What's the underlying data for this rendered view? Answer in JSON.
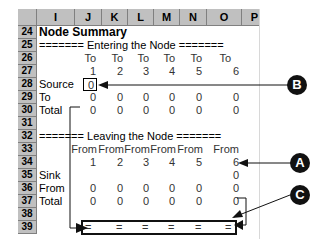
{
  "columns": [
    "I",
    "J",
    "K",
    "L",
    "M",
    "N",
    "O",
    "P"
  ],
  "rows": [
    "24",
    "25",
    "26",
    "27",
    "28",
    "29",
    "30",
    "31",
    "32",
    "33",
    "34",
    "35",
    "36",
    "37",
    "38",
    "39"
  ],
  "title": "Node Summary",
  "entering": {
    "header": "======= Entering the Node =======",
    "to_labels": [
      "To",
      "To",
      "To",
      "To",
      "To",
      "To"
    ],
    "nodes": [
      "1",
      "2",
      "3",
      "4",
      "5",
      "6"
    ],
    "source_label": "Source",
    "source_value": "0",
    "to_label": "To",
    "to_values": [
      "0",
      "0",
      "0",
      "0",
      "0",
      "0"
    ],
    "total_label": "Total",
    "total_values": [
      "0",
      "0",
      "0",
      "0",
      "0",
      "0"
    ]
  },
  "leaving": {
    "header": "======= Leaving the Node =======",
    "from_labels": [
      "From",
      "From",
      "From",
      "From",
      "From",
      "From"
    ],
    "nodes": [
      "1",
      "2",
      "3",
      "4",
      "5",
      "6"
    ],
    "sink_label": "Sink",
    "sink_value": "0",
    "from_label": "From",
    "from_values": [
      "0",
      "0",
      "0",
      "0",
      "0",
      "0"
    ],
    "total_label": "Total",
    "total_values": [
      "0",
      "0",
      "0",
      "0",
      "0",
      "0"
    ]
  },
  "check_row": [
    "=",
    "=",
    "=",
    "=",
    "=",
    "="
  ],
  "callouts": {
    "a": "A",
    "b": "B",
    "c": "C"
  }
}
